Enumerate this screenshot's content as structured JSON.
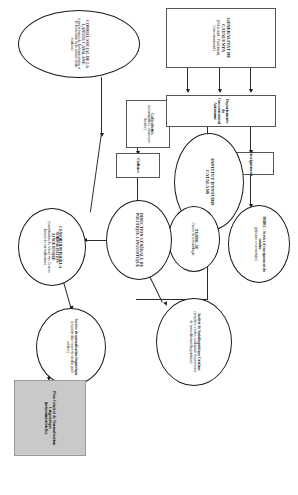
{
  "diagram": {
    "nodes": {
      "generalitat": {
        "title": "GENERALITAT DE CATALUNYA",
        "subtitle": "(Président, Parlement, Gouvernement)"
      },
      "collectivites": {
        "title": "Collectivités",
        "subtitle": "(municipalités, communes locales)"
      },
      "conseil_social": {
        "title": "CONSEIL SOCIAL DE LA LANGUE CATALANE",
        "subtitle": "(représentants de l'administration et de l'ensemble de la société civile catalane)"
      },
      "departements": {
        "title": "Departements du Gouvernement Autonome"
      },
      "enseignement": {
        "title": "Enseignement"
      },
      "culture": {
        "title": "Culture"
      },
      "institut_estudis": {
        "title": "INSTITUT D'ESTUDIS CATALANS"
      },
      "sedec": {
        "title": "SEDEC : Service d'enseignement du catalan",
        "subtitle": "(primaire et secondaire)"
      },
      "termcat": {
        "title": "TERMCAT",
        "subtitle": "Centre de terminologie"
      },
      "dgpl": {
        "title": "DIRECTION GÉNÉRALE DE POLITIQUE LINGUISTIQUE"
      },
      "institut_socio": {
        "title": "Institut de Sociolinguistique Catalane",
        "subtitle": "(enquêtes, études, évaluation du processus de normalisation linguistique)"
      },
      "consortium": {
        "title": "CONSORTIUM POUR LA NORMALISATION LINGUISTIQUE",
        "subtitle": "(coordination du réseau des Centres locaux de normalisation)"
      },
      "service_norm": {
        "title": "Service de normalisation linguistique",
        "subtitle": "(en particulier cours de catalan pour adultes)"
      },
      "plan_general": {
        "title": "Plan Général de Normalisation Linguistique",
        "subtitle": "(interministérielle)"
      }
    },
    "edge_labels": {
      "enseignement": "Enseignement",
      "culture": "Culture"
    },
    "colors": {
      "stroke": "#1a1a1a",
      "box_stroke": "#555555",
      "highlight_fill": "#c9c9c9",
      "background": "#ffffff"
    }
  }
}
